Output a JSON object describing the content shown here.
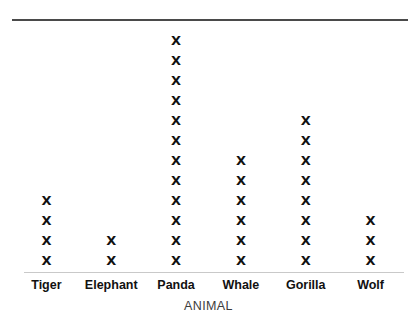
{
  "chart_data": {
    "type": "bar",
    "title": "Favorite Wild Animals",
    "subtitle": "",
    "xlabel": "ANIMAL",
    "ylabel": "",
    "categories": [
      "Tiger",
      "Elephant",
      "Panda",
      "Whale",
      "Gorilla",
      "Wolf"
    ],
    "values": [
      4,
      2,
      12,
      6,
      8,
      3
    ],
    "marker": "X",
    "unit_per_marker": 1,
    "grid": false,
    "legend": null,
    "ylim": [
      0,
      12
    ]
  },
  "axis": {
    "x_title": "ANIMAL"
  },
  "marks": {
    "glyph": "X"
  },
  "colors": {
    "background": "#ffffff",
    "mark": "#111111",
    "label": "#111111",
    "axis_title": "#3c3c3c",
    "rule_top": "#4a4a4a",
    "rule_bottom": "#c9c9c9"
  }
}
